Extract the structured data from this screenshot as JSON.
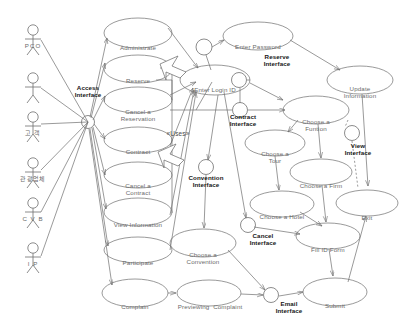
{
  "diagram": {
    "stroke_color": "#6f6f6f",
    "text_color": "#6b6b6b",
    "bold_text_color": "#161616",
    "background": "#ffffff"
  },
  "actors": [
    {
      "name": "actor-pco",
      "label": "PCO",
      "x": 33,
      "y": 30
    },
    {
      "name": "actor-blank",
      "label": "",
      "x": 33,
      "y": 78
    },
    {
      "name": "actor-gogaek",
      "label": "고 객",
      "x": 33,
      "y": 117
    },
    {
      "name": "actor-company",
      "label": "관광업체",
      "x": 33,
      "y": 163
    },
    {
      "name": "actor-cvb",
      "label": "C V B",
      "x": 33,
      "y": 203
    },
    {
      "name": "actor-ip",
      "label": "I P",
      "x": 33,
      "y": 248
    }
  ],
  "hub": {
    "label": "Access\nInterface",
    "x": 88,
    "y": 122,
    "label_x": 88,
    "label_y": 90
  },
  "use_cases": [
    {
      "name": "uc-administrate",
      "label": "Administrate",
      "cx": 138,
      "cy": 33,
      "rx": 34,
      "ry": 15
    },
    {
      "name": "uc-reserve",
      "label": "Reserve",
      "cx": 138,
      "cy": 69,
      "rx": 34,
      "ry": 14
    },
    {
      "name": "uc-cancel-reservation",
      "label": "Cancel a\nReservation",
      "cx": 138,
      "cy": 100,
      "rx": 34,
      "ry": 13
    },
    {
      "name": "uc-contract",
      "label": "Contract",
      "cx": 138,
      "cy": 140,
      "rx": 34,
      "ry": 13
    },
    {
      "name": "uc-cancel-contract",
      "label": "Cancel a\nContract",
      "cx": 138,
      "cy": 175,
      "rx": 34,
      "ry": 13
    },
    {
      "name": "uc-view-information",
      "label": "View Information",
      "cx": 138,
      "cy": 212,
      "rx": 34,
      "ry": 14
    },
    {
      "name": "uc-participate",
      "label": "Participate",
      "cx": 138,
      "cy": 250,
      "rx": 34,
      "ry": 13
    },
    {
      "name": "uc-complain",
      "label": "Complain",
      "cx": 135,
      "cy": 293,
      "rx": 33,
      "ry": 14
    },
    {
      "name": "uc-enter-login-id",
      "label": "Enter Login ID",
      "cx": 215,
      "cy": 80,
      "rx": 35,
      "ry": 15
    },
    {
      "name": "uc-enter-password",
      "label": "Enter Password",
      "cx": 258,
      "cy": 36,
      "rx": 35,
      "ry": 14
    },
    {
      "name": "uc-update-information",
      "label": "Update\nInformation",
      "cx": 360,
      "cy": 80,
      "rx": 33,
      "ry": 14
    },
    {
      "name": "uc-choose-a-function",
      "label": "Choose a\nFuntion",
      "cx": 316,
      "cy": 110,
      "rx": 33,
      "ry": 14
    },
    {
      "name": "uc-choose-a-tour",
      "label": "Choose a\nTour",
      "cx": 275,
      "cy": 143,
      "rx": 30,
      "ry": 13
    },
    {
      "name": "uc-choose-a-firm",
      "label": "Choose a Firm",
      "cx": 321,
      "cy": 172,
      "rx": 31,
      "ry": 13
    },
    {
      "name": "uc-choose-a-hotel",
      "label": "Choose a Hotel",
      "cx": 282,
      "cy": 204,
      "rx": 32,
      "ry": 13
    },
    {
      "name": "uc-fill-id-form",
      "label": "Fill ID Form",
      "cx": 328,
      "cy": 236,
      "rx": 32,
      "ry": 13
    },
    {
      "name": "uc-exit",
      "label": "Exit",
      "cx": 367,
      "cy": 203,
      "rx": 31,
      "ry": 13
    },
    {
      "name": "uc-submit",
      "label": "Submit",
      "cx": 335,
      "cy": 292,
      "rx": 32,
      "ry": 14
    },
    {
      "name": "uc-choose-a-convention",
      "label": "Choose a\nConvention",
      "cx": 203,
      "cy": 243,
      "rx": 33,
      "ry": 14
    },
    {
      "name": "uc-previewing-complaint",
      "label": "Previewing  Complaint",
      "cx": 209,
      "cy": 293,
      "rx": 32,
      "ry": 13
    }
  ],
  "interfaces": [
    {
      "name": "iface-reserve",
      "label": "Reserve\nInterface",
      "cx": 204,
      "cy": 47,
      "r": 8,
      "label_x": 277,
      "label_y": 58
    },
    {
      "name": "iface-contract",
      "label": "Contract\nInterface",
      "cx": 239,
      "cy": 80,
      "r": 7.5,
      "label_x": 243,
      "label_y": 118
    },
    {
      "name": "iface-view",
      "label": "View\nInterface",
      "cx": 240,
      "cy": 110,
      "r": 7.5,
      "label_x": 358,
      "label_y": 147
    },
    {
      "name": "iface-convention",
      "label": "Convention\nInterface",
      "cx": 206,
      "cy": 167,
      "r": 7.5,
      "label_x": 206,
      "label_y": 178
    },
    {
      "name": "iface-cancel",
      "label": "Cancel\nInterface",
      "cx": 248,
      "cy": 225,
      "r": 7.5,
      "label_x": 263,
      "label_y": 236
    },
    {
      "name": "iface-email",
      "label": "Email\nInterface",
      "cx": 271,
      "cy": 295,
      "r": 7.5,
      "label_x": 289,
      "label_y": 296
    },
    {
      "name": "iface-view-port",
      "label": "",
      "cx": 352,
      "cy": 133,
      "r": 7.5,
      "label_x": 0,
      "label_y": 0
    }
  ],
  "stereotypes": [
    {
      "name": "uses-stereotype-1",
      "label": "«Uses»",
      "x": 178,
      "y": 134
    }
  ],
  "relations": {
    "uses_arrows": 2,
    "association_count": 42,
    "notes": "open-triangle generalization arrows between Reserve/Contract and Enter Login ID"
  }
}
